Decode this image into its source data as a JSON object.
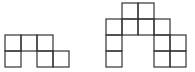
{
  "figures": [
    {
      "name": "left-polyomino",
      "origin": [
        5,
        35
      ],
      "cell_size": 16,
      "cells": [
        [
          0,
          0
        ],
        [
          1,
          0
        ],
        [
          2,
          0
        ],
        [
          0,
          1
        ],
        [
          2,
          1
        ],
        [
          3,
          1
        ]
      ]
    },
    {
      "name": "right-polyomino",
      "origin": [
        106,
        3
      ],
      "cell_size": 16,
      "cells": [
        [
          1,
          0
        ],
        [
          2,
          0
        ],
        [
          0,
          1
        ],
        [
          1,
          1
        ],
        [
          2,
          1
        ],
        [
          3,
          1
        ],
        [
          0,
          2
        ],
        [
          3,
          2
        ],
        [
          4,
          2
        ],
        [
          0,
          3
        ],
        [
          3,
          3
        ],
        [
          4,
          3
        ]
      ]
    }
  ],
  "colors": {
    "stroke": "#333333",
    "background": "#ffffff"
  }
}
